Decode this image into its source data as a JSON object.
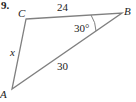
{
  "problem_number": "9.",
  "vertices": {
    "A": {
      "label": "A",
      "x": 12,
      "y": 89
    },
    "B": {
      "label": "B",
      "x": 122,
      "y": 13
    },
    "C": {
      "label": "C",
      "x": 26,
      "y": 19
    }
  },
  "sides": {
    "CB": "24",
    "AB": "30",
    "CA": "x"
  },
  "angle_B": "30°",
  "colors": {
    "line": "#808080",
    "text": "#222222"
  }
}
